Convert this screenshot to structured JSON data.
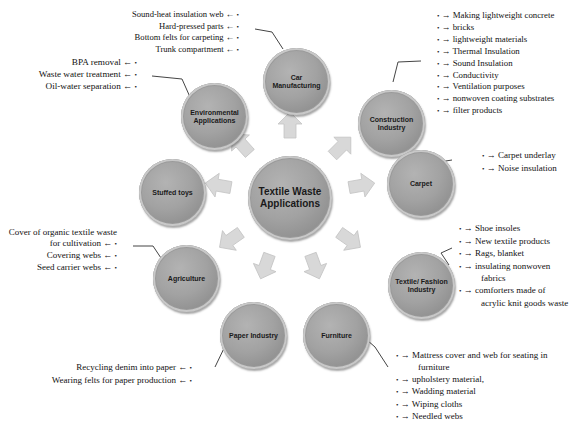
{
  "center": {
    "label": "Textile Waste Applications"
  },
  "nodes": [
    {
      "id": "car",
      "label": "Car Manufacturing"
    },
    {
      "id": "construction",
      "label": "Construction Industry"
    },
    {
      "id": "carpet",
      "label": "Carpet"
    },
    {
      "id": "textile",
      "label": "Textile/ Fashion Industry"
    },
    {
      "id": "furniture",
      "label": "Furniture"
    },
    {
      "id": "paper",
      "label": "Paper Industry"
    },
    {
      "id": "agriculture",
      "label": "Agriculture"
    },
    {
      "id": "stuffed",
      "label": "Stuffed toys"
    },
    {
      "id": "environmental",
      "label": "Environmental Applications"
    }
  ],
  "lists": {
    "car": [
      "Sound-heat insulation web",
      "Hard-pressed parts",
      "Bottom felts for carpeting",
      "Trunk compartment"
    ],
    "construction": [
      "Making lightweight concrete",
      "bricks",
      "lightweight materials",
      "Thermal Insulation",
      "Sound Insulation",
      "Conductivity",
      "Ventilation purposes",
      "nonwoven coating substrates",
      "filter products"
    ],
    "carpet": [
      "Carpet underlay",
      "Noise insulation"
    ],
    "textile": [
      "Shoe insoles",
      "New textile products",
      "Rags, blanket",
      "insulating nonwoven fabrics",
      "comforters made of acrylic knit goods waste"
    ],
    "furniture": [
      "Mattress cover and web for seating in furniture",
      "upholstery material,",
      "Wadding material",
      "Wiping cloths",
      "Needled webs"
    ],
    "paper": [
      "Recycling denim into paper",
      "Wearing felts for paper production"
    ],
    "agriculture": [
      "Cover of organic textile waste for cultivation",
      "Covering webs",
      "Seed carrier webs"
    ],
    "environmental": [
      "BPA removal",
      "Waste water treatment",
      "Oil-water separation"
    ]
  },
  "markers": {
    "bullet": "•",
    "arrow_right": "→",
    "arrow_left": "←"
  },
  "colors": {
    "node_fill": "#a0a0a0",
    "arrow_fill": "#d9d9d9",
    "text": "#111111"
  }
}
